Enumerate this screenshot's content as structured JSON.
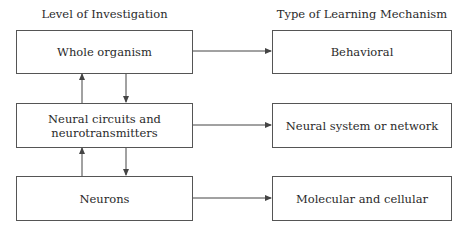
{
  "headers": {
    "left": "Level of Investigation",
    "right": "Type of Learning Mechanism"
  },
  "levels": [
    {
      "label": "Whole organism"
    },
    {
      "label_line1": "Neural circuits and",
      "label_line2": "neurotransmitters"
    },
    {
      "label": "Neurons"
    }
  ],
  "mechanisms": [
    {
      "label": "Behavioral"
    },
    {
      "label": "Neural system or network"
    },
    {
      "label": "Molecular and cellular"
    }
  ],
  "colors": {
    "line": "#444444",
    "text": "#2a2a2a"
  }
}
